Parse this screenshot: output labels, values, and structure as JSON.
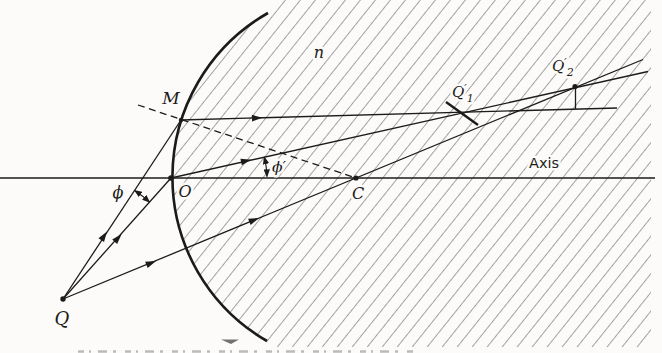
{
  "figure": {
    "description_labels": {
      "medium_index": "n",
      "point_m": "M",
      "point_o": "O",
      "point_c": "C",
      "point_q": "Q",
      "axis": "Axis",
      "angle_phi": "ϕ",
      "angle_phi_prime": "ϕ′",
      "image_q1": {
        "base": "Q",
        "prime": "′",
        "sub": "1"
      },
      "image_q2": {
        "base": "Q",
        "prime": "′",
        "sub": "2"
      }
    },
    "colors": {
      "ink": "#1b1b1b",
      "hatch": "#4a4a4a",
      "paper": "#fcfbf9"
    }
  }
}
